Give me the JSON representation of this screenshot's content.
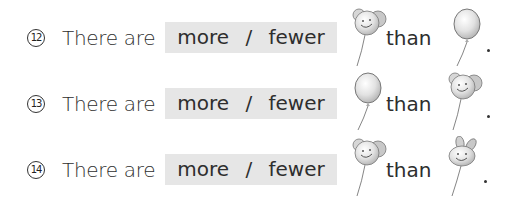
{
  "questions": [
    {
      "number": "12",
      "lead_text": "There are",
      "choice_a": "more",
      "separator": "/",
      "choice_b": "fewer",
      "first_balloon": "bear-balloon",
      "connector": "than",
      "second_balloon": "round-balloon",
      "end": "."
    },
    {
      "number": "13",
      "lead_text": "There are",
      "choice_a": "more",
      "separator": "/",
      "choice_b": "fewer",
      "first_balloon": "round-balloon",
      "connector": "than",
      "second_balloon": "bear-balloon",
      "end": "."
    },
    {
      "number": "14",
      "lead_text": "There are",
      "choice_a": "more",
      "separator": "/",
      "choice_b": "fewer",
      "first_balloon": "bear-balloon",
      "connector": "than",
      "second_balloon": "rabbit-balloon",
      "end": "."
    }
  ],
  "colors": {
    "pill_background": "#e6e6e6",
    "text": "#2e2e2e",
    "balloon_fill": "#d9d9d9"
  }
}
